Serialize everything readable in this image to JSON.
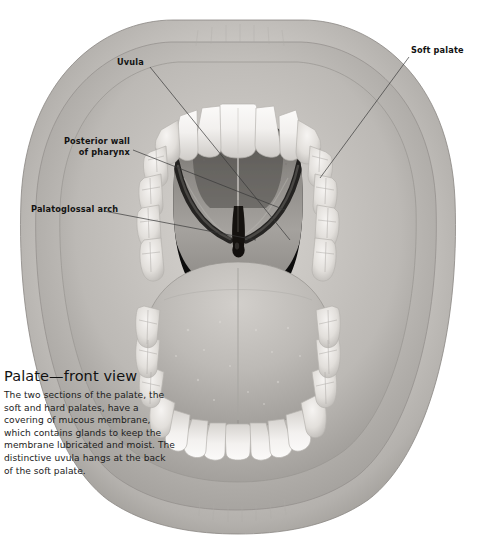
{
  "figure": {
    "style": "grayscale-medical-illustration",
    "background_color": "#ffffff",
    "palette": {
      "lip_light": "#dedcd9",
      "lip_mid": "#bdbab6",
      "lip_shadow": "#8e8b88",
      "gum_light": "#cfccc8",
      "gum_mid": "#b2afab",
      "tooth_white": "#f7f6f4",
      "tooth_shade": "#cbc8c4",
      "oral_cavity_dark": "#141414",
      "palate_mid": "#8b8884",
      "palate_light": "#a8a5a1",
      "tongue_light": "#c6c3bf",
      "tongue_mid": "#a9a6a2",
      "leader_line": "#3a3a3a"
    }
  },
  "labels": [
    {
      "id": "uvula",
      "text": "Uvula"
    },
    {
      "id": "soft_palate",
      "text": "Soft palate"
    },
    {
      "id": "posterior_wall",
      "text": "Posterior wall\nof pharynx"
    },
    {
      "id": "palatoglossal_arch",
      "text": "Palatoglossal arch"
    }
  ],
  "caption": {
    "title": "Palate—front view",
    "body": "The two sections of the palate, the soft and hard palates, have a covering of mucous membrane, which contains glands to keep the membrane lubricated and moist. The distinctive uvula hangs at the back of the soft palate."
  }
}
